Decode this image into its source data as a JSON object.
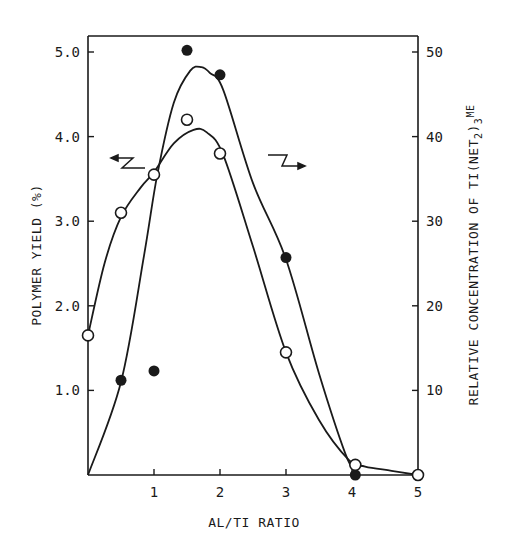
{
  "chart_data": {
    "type": "scatter",
    "title": "",
    "xlabel": "Al/Ti RATIO",
    "ylabel": "POLYMER YIELD (%)",
    "ylabel_right": "Relative Concentration of Ti(NEt2)3Me",
    "xlim": [
      0,
      5
    ],
    "ylim": [
      0,
      5.2
    ],
    "ylim_right": [
      0,
      52
    ],
    "grid": false,
    "legend": "none (arrows indicate axis: left arrow near open curve region, right arrow near filled curve)",
    "x_ticks": [
      "1",
      "2",
      "3",
      "4",
      "5"
    ],
    "y_ticks_left": [
      "1.0",
      "2.0",
      "3.0",
      "4.0",
      "5.0"
    ],
    "y_ticks_right": [
      "10",
      "20",
      "30",
      "40",
      "50"
    ],
    "series": [
      {
        "name": "Polymer yield (%)",
        "marker": "filled-circle",
        "axis": "left",
        "x": [
          0.5,
          1.0,
          1.5,
          2.0,
          3.0,
          4.05
        ],
        "y": [
          1.12,
          1.23,
          5.02,
          4.73,
          2.57,
          0.0
        ]
      },
      {
        "name": "Relative concentration of Ti(NEt2)3Me",
        "marker": "open-circle",
        "axis": "right",
        "x": [
          0.0,
          0.5,
          1.0,
          1.5,
          2.0,
          3.0,
          4.05,
          5.0
        ],
        "y": [
          16.5,
          31.0,
          35.5,
          42.0,
          38.0,
          14.5,
          1.2,
          0.0
        ]
      }
    ],
    "annotations": [
      "left-pointing arrow (yield axis)",
      "right-pointing arrow (concentration axis)"
    ]
  },
  "labels": {
    "x_axis": "AL/TI  RATIO",
    "y_left": "POLYMER  YIELD (%)",
    "y_right_main": "RELATIVE CONCENTRATION OF TI(NET",
    "y_right_sub2": "2",
    "y_right_paren": ")",
    "y_right_sub3": "3",
    "y_right_me": "ME"
  }
}
